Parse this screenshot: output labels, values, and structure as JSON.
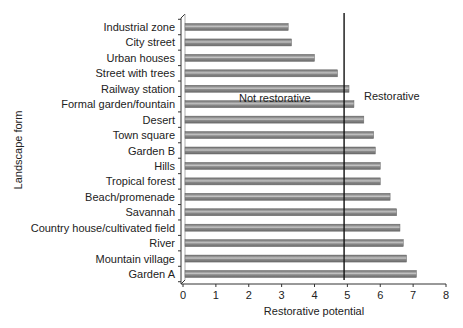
{
  "chart_data": {
    "type": "bar",
    "orientation": "horizontal",
    "title": "",
    "xlabel": "Restorative potential",
    "ylabel": "Landscape form",
    "xlim": [
      0,
      8
    ],
    "xticks": [
      0,
      1,
      2,
      3,
      4,
      5,
      6,
      7,
      8
    ],
    "grid": false,
    "legend": null,
    "categories": [
      "Industrial zone",
      "City street",
      "Urban houses",
      "Street with trees",
      "Railway station",
      "Formal garden/fountain",
      "Desert",
      "Town square",
      "Garden B",
      "Hills",
      "Tropical forest",
      "Beach/promenade",
      "Savannah",
      "Country house/cultivated field",
      "River",
      "Mountain village",
      "Garden A"
    ],
    "values": [
      3.2,
      3.3,
      4.0,
      4.7,
      5.05,
      5.2,
      5.5,
      5.8,
      5.85,
      6.0,
      6.0,
      6.3,
      6.5,
      6.6,
      6.7,
      6.8,
      7.1
    ],
    "threshold": {
      "value": 4.9,
      "left_label": "Not restorative",
      "right_label": "Restorative"
    },
    "colors": {
      "bar_fill": "#8c8c8c",
      "bar_highlight": "#c4c4c4",
      "bar_edge": "#6a6a6a",
      "axis": "#333333",
      "threshold_line": "#111111"
    }
  }
}
